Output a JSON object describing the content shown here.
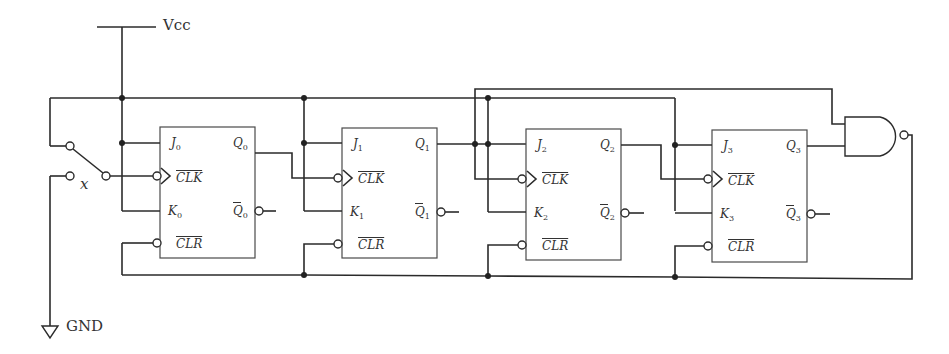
{
  "power": {
    "vcc_label": "Vcc",
    "gnd_label": "GND"
  },
  "switch": {
    "label": "x"
  },
  "flipflops": [
    {
      "id": "ff0",
      "J": "J",
      "K": "K",
      "Q": "Q",
      "Qbar": "Q",
      "sub": "0",
      "clk": "CLK",
      "clr": "CLR"
    },
    {
      "id": "ff1",
      "J": "J",
      "K": "K",
      "Q": "Q",
      "Qbar": "Q",
      "sub": "1",
      "clk": "CLK",
      "clr": "CLR"
    },
    {
      "id": "ff2",
      "J": "J",
      "K": "K",
      "Q": "Q",
      "Qbar": "Q",
      "sub": "2",
      "clk": "CLK",
      "clr": "CLR"
    },
    {
      "id": "ff3",
      "J": "J",
      "K": "K",
      "Q": "Q",
      "Qbar": "Q",
      "sub": "3",
      "clk": "CLK",
      "clr": "CLR"
    }
  ],
  "gate": {
    "type": "NAND",
    "inputs": [
      "Q1",
      "Q3"
    ]
  },
  "colors": {
    "wire": "#2b2b2b",
    "box": "#4a4a4a",
    "background": "#ffffff"
  }
}
